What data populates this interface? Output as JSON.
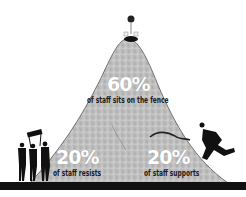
{
  "diagram": {
    "title": "",
    "segments": [
      {
        "id": "fence",
        "percent": "60%",
        "label": "of staff sits on the fence",
        "position": "peak"
      },
      {
        "id": "resists",
        "percent": "20%",
        "label": "of staff resists",
        "position": "left"
      },
      {
        "id": "supports",
        "percent": "20%",
        "label": "of staff supports",
        "position": "right"
      }
    ],
    "figures": [
      {
        "name": "group-with-banner",
        "description": "Three silhouetted people holding a protest banner at the left foot of the hill"
      },
      {
        "name": "running-man",
        "description": "Silhouette of a man running up the right slope"
      },
      {
        "name": "figure-on-peak",
        "description": "Figure sitting on top of the hill with a balloon"
      }
    ],
    "colors": {
      "hill": "#b8b8b8",
      "ground": "#111111",
      "percent_text": "#ffffff",
      "label_text": "#1a1a1a",
      "background": "#ffffff"
    }
  }
}
